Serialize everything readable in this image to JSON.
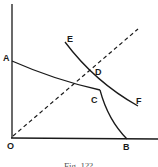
{
  "figure": {
    "caption": "Fig. 1??",
    "labels": {
      "A": "A",
      "B": "B",
      "C": "C",
      "D": "D",
      "E": "E",
      "F": "F",
      "O": "O"
    },
    "colors": {
      "ink": "#1a1a1a",
      "background": "#ffffff"
    },
    "elements": {
      "y_axis": "vertical axis from O",
      "x_axis": "horizontal axis from O",
      "curve_ACB": "kinked curve from A on y-axis to C then down to B on x-axis",
      "curve_EF": "downward sloping curve from E to F passing through D",
      "ray_OD": "dashed ray from origin O through D"
    }
  }
}
